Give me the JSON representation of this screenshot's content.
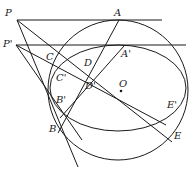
{
  "diagram": {
    "type": "projective-geometry-figure",
    "stroke_color": "#1a1a1a",
    "points": [
      {
        "id": "P",
        "label": "P",
        "x": 17,
        "y": 20,
        "label_x": 5,
        "label_y": 10
      },
      {
        "id": "P_prime",
        "label": "P'",
        "x": 16,
        "y": 45,
        "label_x": 3,
        "label_y": 39
      },
      {
        "id": "A",
        "label": "A",
        "x": 119,
        "y": 20,
        "label_x": 114,
        "label_y": 8
      },
      {
        "id": "A_prime",
        "label": "A'",
        "x": 125,
        "y": 45,
        "label_x": 121,
        "label_y": 49
      },
      {
        "id": "C",
        "label": "C",
        "x": 58,
        "y": 58,
        "label_x": 46,
        "label_y": 52
      },
      {
        "id": "C_prime",
        "label": "C'",
        "x": 63,
        "y": 72,
        "label_x": 56,
        "label_y": 73
      },
      {
        "id": "D",
        "label": "D",
        "x": 88,
        "y": 71,
        "label_x": 84,
        "label_y": 58
      },
      {
        "id": "D_prime",
        "label": "D'",
        "x": 90,
        "y": 78,
        "label_x": 85,
        "label_y": 81
      },
      {
        "id": "O",
        "label": "O",
        "x": 121,
        "y": 90,
        "label_x": 119,
        "label_y": 79
      },
      {
        "id": "B_prime",
        "label": "B'",
        "x": 61,
        "y": 106,
        "label_x": 56,
        "label_y": 95
      },
      {
        "id": "B",
        "label": "B",
        "x": 63,
        "y": 130,
        "label_x": 49,
        "label_y": 124
      },
      {
        "id": "E_prime",
        "label": "E'",
        "x": 167,
        "y": 124,
        "label_x": 167,
        "label_y": 100
      },
      {
        "id": "E",
        "label": "E",
        "x": 170,
        "y": 140,
        "label_x": 174,
        "label_y": 131
      }
    ],
    "circle": {
      "cx": 118,
      "cy": 90,
      "r": 70
    },
    "ellipse": {
      "cx": 118,
      "cy": 88,
      "rx": 68,
      "ry": 43
    }
  }
}
